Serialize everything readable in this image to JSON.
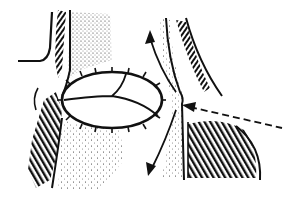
{
  "illustration": {
    "type": "anatomical line drawing",
    "width": 298,
    "height": 197,
    "colors": {
      "ink": "#111111",
      "background": "#ffffff"
    },
    "elements": [
      "left-tissue-wall",
      "hatched-left-muscle",
      "stippled-left-column",
      "sutured-oval-valve",
      "valve-leaflet-lines",
      "up-arrow",
      "down-arrow",
      "right-hatched-tissue",
      "right-outer-curve",
      "dashed-pointer-line"
    ]
  }
}
